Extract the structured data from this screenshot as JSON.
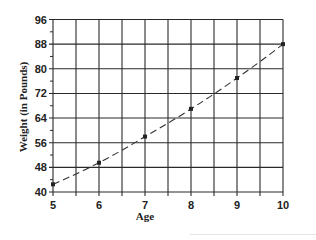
{
  "chart_data": {
    "type": "line",
    "title": "",
    "xlabel": "Age",
    "ylabel": "Weight (in Pounds)",
    "x": [
      5,
      6,
      7,
      8,
      9,
      10
    ],
    "series": [
      {
        "name": "Weight",
        "values": [
          42.5,
          49.5,
          58,
          67,
          77,
          88
        ],
        "style": "dashed",
        "markers": true
      }
    ],
    "xlim": [
      5,
      10
    ],
    "ylim": [
      40,
      96
    ],
    "xticks": [
      5,
      6,
      7,
      8,
      9,
      10
    ],
    "yticks": [
      40,
      48,
      56,
      64,
      72,
      80,
      88,
      96
    ],
    "grid": true,
    "grid_x_step": 0.5,
    "grid_y_step": 8,
    "legend": null
  },
  "colors": {
    "line": "#333333",
    "grid": "#2a2a2a",
    "text": "#222222"
  }
}
